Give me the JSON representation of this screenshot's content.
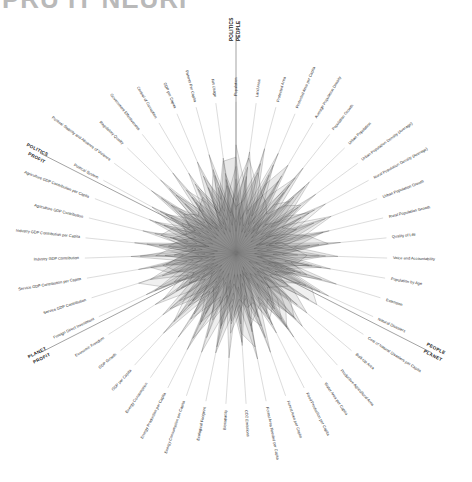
{
  "header": {
    "title_partial": "PRU IT NEURI",
    "title_color": "#b9b9b9"
  },
  "chart_data": {
    "type": "radar",
    "title": "PRU IT NEURI",
    "grid": false,
    "legend_position": "none",
    "center": [
      236,
      253
    ],
    "radius": 168,
    "group_dividers": [
      {
        "labels": [
          "POLITICS",
          "PEOPLE"
        ],
        "angle_deg": -90
      },
      {
        "labels": [
          "PEOPLE",
          "PLANET"
        ],
        "angle_deg": 27
      },
      {
        "labels": [
          "PROFIT",
          "PLANET"
        ],
        "angle_deg": 153
      },
      {
        "labels": [
          "PROFIT",
          "POLITICS"
        ],
        "angle_deg": 207
      }
    ],
    "categories": [
      "Population",
      "Land Area",
      "Protected Area",
      "Protected Area per Capita",
      "Average Population Density",
      "Population Growth",
      "Urban Population",
      "Urban Population Density (Average)",
      "Rural Population Density (Average)",
      "Urban Population Growth",
      "Rural Population Growth",
      "Quality of Life",
      "Voice and Accountability",
      "Population by Age",
      "Extension",
      "Natural Disasters",
      "Cost of Natural Disasters per Capita",
      "Built-Up Area",
      "Productive Agricultural Area",
      "Water Area per Capita",
      "Food Production per Capita",
      "Forest Area per Capita",
      "Forest Area Needed per Capita",
      "CO2 Emissions",
      "Biocapacity",
      "Ecological Footprint",
      "Energy Consumption per Capita",
      "Energy Production per Capita",
      "Energy Consumption",
      "GDP per Capita",
      "GDP Growth",
      "Economic Freedom",
      "Foreign Direct Investment",
      "Service GDP Contribution",
      "Service GDP Contribution per Capita",
      "Industry GDP Contribution",
      "Industry GDP Contribution per Capita",
      "Agriculture GDP Contribution",
      "Agriculture GDP Contribution per Capita",
      "Political System",
      "Political Stability and Absence of Violence",
      "Regulatory Quality",
      "Government Effectiveness",
      "Control of Corruption",
      "GDP per Capita ",
      "Patents Per Capita",
      "Net Usage"
    ],
    "value_range": [
      0,
      1
    ],
    "series": [
      {
        "name": "s1",
        "opacity": 0.1,
        "values": [
          0.62,
          0.3,
          0.18,
          0.55,
          0.22,
          0.7,
          0.34,
          0.12,
          0.48,
          0.26,
          0.62,
          0.2,
          0.4,
          0.16,
          0.58,
          0.3,
          0.1,
          0.52,
          0.24,
          0.66,
          0.18,
          0.44,
          0.28,
          0.6,
          0.14,
          0.5,
          0.32,
          0.7,
          0.22,
          0.4,
          0.56,
          0.18,
          0.64,
          0.26,
          0.46,
          0.34,
          0.58,
          0.2,
          0.5,
          0.3,
          0.68,
          0.24,
          0.42,
          0.14,
          0.54,
          0.36,
          0.6
        ]
      },
      {
        "name": "s2",
        "opacity": 0.09,
        "values": [
          0.28,
          0.66,
          0.4,
          0.14,
          0.58,
          0.22,
          0.62,
          0.36,
          0.18,
          0.54,
          0.26,
          0.68,
          0.16,
          0.48,
          0.3,
          0.6,
          0.2,
          0.42,
          0.64,
          0.24,
          0.52,
          0.12,
          0.7,
          0.34,
          0.46,
          0.18,
          0.58,
          0.28,
          0.66,
          0.14,
          0.38,
          0.62,
          0.2,
          0.5,
          0.32,
          0.68,
          0.22,
          0.44,
          0.16,
          0.56,
          0.3,
          0.6,
          0.24,
          0.52,
          0.34,
          0.14,
          0.48
        ]
      },
      {
        "name": "s3",
        "opacity": 0.11,
        "values": [
          0.48,
          0.18,
          0.7,
          0.34,
          0.12,
          0.5,
          0.24,
          0.64,
          0.3,
          0.16,
          0.58,
          0.38,
          0.66,
          0.22,
          0.44,
          0.14,
          0.56,
          0.28,
          0.18,
          0.6,
          0.32,
          0.68,
          0.2,
          0.46,
          0.26,
          0.62,
          0.14,
          0.52,
          0.36,
          0.7,
          0.18,
          0.42,
          0.3,
          0.14,
          0.64,
          0.24,
          0.5,
          0.32,
          0.6,
          0.18,
          0.46,
          0.28,
          0.66,
          0.2,
          0.4,
          0.56,
          0.24
        ]
      },
      {
        "name": "s4",
        "opacity": 0.08,
        "values": [
          0.7,
          0.44,
          0.26,
          0.62,
          0.34,
          0.16,
          0.52,
          0.28,
          0.66,
          0.4,
          0.2,
          0.54,
          0.3,
          0.62,
          0.18,
          0.46,
          0.36,
          0.14,
          0.58,
          0.3,
          0.1,
          0.5,
          0.42,
          0.22,
          0.68,
          0.3,
          0.2,
          0.44,
          0.14,
          0.56,
          0.32,
          0.24,
          0.52,
          0.66,
          0.18,
          0.4,
          0.28,
          0.62,
          0.22,
          0.48,
          0.16,
          0.54,
          0.34,
          0.6,
          0.26,
          0.44,
          0.18
        ]
      },
      {
        "name": "s5",
        "opacity": 0.12,
        "values": [
          0.34,
          0.56,
          0.14,
          0.48,
          0.66,
          0.28,
          0.18,
          0.5,
          0.24,
          0.62,
          0.36,
          0.14,
          0.54,
          0.32,
          0.68,
          0.22,
          0.44,
          0.6,
          0.26,
          0.16,
          0.58,
          0.3,
          0.52,
          0.14,
          0.4,
          0.66,
          0.24,
          0.18,
          0.48,
          0.28,
          0.62,
          0.34,
          0.16,
          0.44,
          0.56,
          0.2,
          0.66,
          0.26,
          0.38,
          0.62,
          0.22,
          0.46,
          0.18,
          0.34,
          0.64,
          0.28,
          0.52
        ]
      },
      {
        "name": "s6",
        "opacity": 0.1,
        "values": [
          0.2,
          0.38,
          0.6,
          0.26,
          0.44,
          0.62,
          0.14,
          0.4,
          0.54,
          0.32,
          0.12,
          0.48,
          0.24,
          0.56,
          0.34,
          0.66,
          0.18,
          0.36,
          0.48,
          0.58,
          0.22,
          0.14,
          0.62,
          0.52,
          0.3,
          0.4,
          0.68,
          0.24,
          0.34,
          0.46,
          0.12,
          0.56,
          0.4,
          0.22,
          0.14,
          0.62,
          0.32,
          0.5,
          0.44,
          0.26,
          0.6,
          0.16,
          0.52,
          0.38,
          0.2,
          0.66,
          0.3
        ]
      },
      {
        "name": "s7",
        "opacity": 0.09,
        "values": [
          0.56,
          0.22,
          0.34,
          0.7,
          0.16,
          0.4,
          0.48,
          0.2,
          0.38,
          0.66,
          0.44,
          0.28,
          0.12,
          0.5,
          0.26,
          0.54,
          0.62,
          0.24,
          0.34,
          0.44,
          0.14,
          0.58,
          0.3,
          0.38,
          0.52,
          0.22,
          0.42,
          0.62,
          0.18,
          0.34,
          0.48,
          0.14,
          0.58,
          0.38,
          0.28,
          0.46,
          0.12,
          0.54,
          0.34,
          0.4,
          0.26,
          0.68,
          0.3,
          0.18,
          0.46,
          0.22,
          0.38
        ]
      },
      {
        "name": "s8",
        "opacity": 0.13,
        "values": [
          0.14,
          0.5,
          0.28,
          0.38,
          0.54,
          0.18,
          0.66,
          0.44,
          0.22,
          0.34,
          0.48,
          0.6,
          0.28,
          0.14,
          0.4,
          0.34,
          0.26,
          0.46,
          0.56,
          0.36,
          0.44,
          0.24,
          0.14,
          0.58,
          0.34,
          0.48,
          0.3,
          0.38,
          0.52,
          0.26,
          0.2,
          0.46,
          0.34,
          0.58,
          0.4,
          0.14,
          0.44,
          0.36,
          0.28,
          0.52,
          0.38,
          0.22,
          0.46,
          0.3,
          0.16,
          0.4,
          0.62
        ]
      },
      {
        "name": "s9",
        "opacity": 0.07,
        "values": [
          0.42,
          0.62,
          0.48,
          0.2,
          0.3,
          0.56,
          0.26,
          0.34,
          0.58,
          0.14,
          0.3,
          0.36,
          0.46,
          0.4,
          0.22,
          0.5,
          0.32,
          0.18,
          0.4,
          0.52,
          0.36,
          0.4,
          0.48,
          0.26,
          0.2,
          0.34,
          0.46,
          0.32,
          0.26,
          0.6,
          0.42,
          0.28,
          0.44,
          0.32,
          0.22,
          0.52,
          0.4,
          0.18,
          0.56,
          0.34,
          0.42,
          0.36,
          0.2,
          0.48,
          0.3,
          0.52,
          0.26
        ]
      },
      {
        "name": "s10",
        "opacity": 0.11,
        "values": [
          0.3,
          0.34,
          0.54,
          0.42,
          0.38,
          0.32,
          0.44,
          0.52,
          0.34,
          0.42,
          0.22,
          0.3,
          0.58,
          0.36,
          0.48,
          0.28,
          0.4,
          0.34,
          0.3,
          0.42,
          0.48,
          0.34,
          0.36,
          0.3,
          0.44,
          0.28,
          0.38,
          0.5,
          0.3,
          0.42,
          0.26,
          0.36,
          0.3,
          0.4,
          0.48,
          0.32,
          0.26,
          0.42,
          0.34,
          0.3,
          0.52,
          0.34,
          0.38,
          0.42,
          0.28,
          0.32,
          0.44
        ]
      }
    ]
  }
}
